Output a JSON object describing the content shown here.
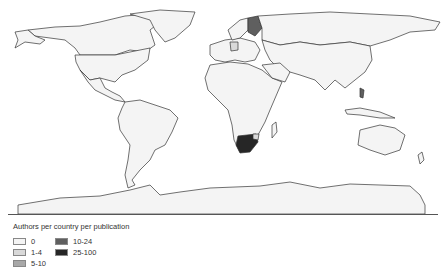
{
  "map": {
    "type": "choropleth world map",
    "highlighted_countries": [
      {
        "name": "South Africa",
        "class": "25-100"
      },
      {
        "name": "Finland",
        "class": "10-24"
      },
      {
        "name": "Lesotho/Eswatini region",
        "class": "1-4"
      },
      {
        "name": "Germany",
        "class": "1-4"
      },
      {
        "name": "Philippines",
        "class": "10-24"
      }
    ]
  },
  "legend": {
    "title": "Authors per country per publication",
    "items": [
      {
        "label": "0",
        "color": "#f4f4f4"
      },
      {
        "label": "1-4",
        "color": "#d9d9d9"
      },
      {
        "label": "5-10",
        "color": "#a8a8a8"
      },
      {
        "label": "10-24",
        "color": "#5f5f5f"
      },
      {
        "label": "25-100",
        "color": "#262626"
      }
    ]
  }
}
